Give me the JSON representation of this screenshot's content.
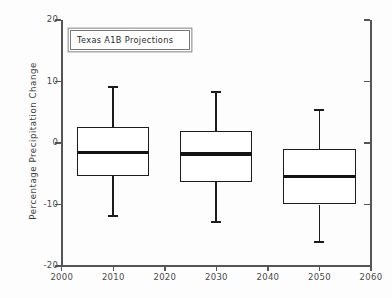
{
  "chart_data": {
    "type": "box",
    "title": "",
    "legend_label": "Texas A1B Projections",
    "legend_position": "top-left-inside",
    "xlabel": "",
    "ylabel": "Percentage Precipitation Change",
    "xlim": [
      2000,
      2060
    ],
    "ylim": [
      -20,
      20
    ],
    "xticks": [
      2000,
      2010,
      2020,
      2030,
      2040,
      2050,
      2060
    ],
    "yticks": [
      20,
      10,
      0,
      -10,
      -20
    ],
    "xticklabels": [
      "2000",
      "2010",
      "2020",
      "2030",
      "2040",
      "2050",
      "2060"
    ],
    "yticklabels": [
      "20",
      "10",
      "0",
      "-10",
      "-20"
    ],
    "grid": false,
    "categories": [
      2010,
      2030,
      2050
    ],
    "boxes": [
      {
        "x": 2010,
        "label": "2010",
        "whisker_high": 9.3,
        "q3": 2.6,
        "median": -1.5,
        "q1": -5.4,
        "whisker_low": -12.0,
        "box_left": 2003,
        "box_right": 2017
      },
      {
        "x": 2030,
        "label": "2030",
        "whisker_high": 8.5,
        "q3": 2.0,
        "median": -1.8,
        "q1": -6.3,
        "whisker_low": -13.0,
        "box_left": 2023,
        "box_right": 2037
      },
      {
        "x": 2050,
        "label": "2050",
        "whisker_high": 5.5,
        "q3": -1.0,
        "median": -5.5,
        "q1": -10.0,
        "whisker_low": -16.3,
        "box_left": 2043,
        "box_right": 2057
      }
    ],
    "colors": {
      "box_edge": "#1c1c1c",
      "box_face": "#ffffff",
      "median": "#141414",
      "whisker": "#1c1c1c",
      "axis": "#555555",
      "background": "#fdfdfd",
      "tick_text": "#4a4a4a"
    }
  }
}
